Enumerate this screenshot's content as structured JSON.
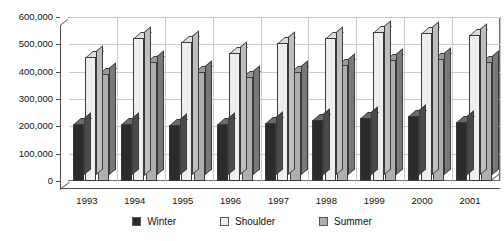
{
  "chart_data": {
    "type": "bar",
    "title": "",
    "xlabel": "",
    "ylabel": "",
    "categories": [
      "1993",
      "1994",
      "1995",
      "1996",
      "1997",
      "1998",
      "1999",
      "2000",
      "2001"
    ],
    "series": [
      {
        "name": "Winter",
        "color": "#2b2b2b",
        "values": [
          208000,
          210000,
          205000,
          208000,
          212000,
          222000,
          232000,
          238000,
          215000
        ]
      },
      {
        "name": "Shoulder",
        "color": "#eeeeec",
        "values": [
          455000,
          525000,
          510000,
          467000,
          505000,
          523000,
          545000,
          540000,
          533000
        ]
      },
      {
        "name": "Summer",
        "color": "#aeaeae",
        "values": [
          390000,
          435000,
          398000,
          380000,
          398000,
          425000,
          443000,
          448000,
          435000
        ]
      }
    ],
    "ylim": [
      0,
      600000
    ],
    "ytick_values": [
      0,
      100000,
      200000,
      300000,
      400000,
      500000,
      600000
    ],
    "ytick_labels": [
      "0",
      "100,000",
      "200,000",
      "300,000",
      "400,000",
      "500,000",
      "600,000"
    ],
    "grid": true,
    "legend_position": "bottom",
    "style": "3d-column"
  },
  "legend": {
    "items": [
      {
        "label": "Winter",
        "swatch": "winter-swatch"
      },
      {
        "label": "Shoulder",
        "swatch": "shoulder-swatch"
      },
      {
        "label": "Summer",
        "swatch": "summer-swatch"
      }
    ]
  }
}
